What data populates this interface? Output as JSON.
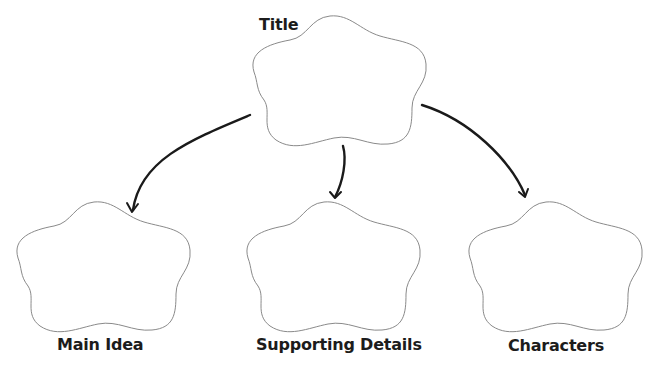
{
  "diagram": {
    "type": "graphic-organizer",
    "nodes": [
      {
        "id": "title",
        "label": "Title",
        "shape": "flower-cloud",
        "role": "root"
      },
      {
        "id": "main-idea",
        "label": "Main Idea",
        "shape": "flower-cloud",
        "role": "child"
      },
      {
        "id": "supporting-details",
        "label": "Supporting Details",
        "shape": "flower-cloud",
        "role": "child"
      },
      {
        "id": "characters",
        "label": "Characters",
        "shape": "flower-cloud",
        "role": "child"
      }
    ],
    "edges": [
      {
        "from": "title",
        "to": "main-idea",
        "style": "curved-arrow"
      },
      {
        "from": "title",
        "to": "supporting-details",
        "style": "curved-arrow"
      },
      {
        "from": "title",
        "to": "characters",
        "style": "curved-arrow"
      }
    ],
    "colors": {
      "background": "#ffffff",
      "cloud_outline": "#8a8a8a",
      "arrow": "#1a1a1a",
      "text": "#1c1c1c"
    }
  }
}
